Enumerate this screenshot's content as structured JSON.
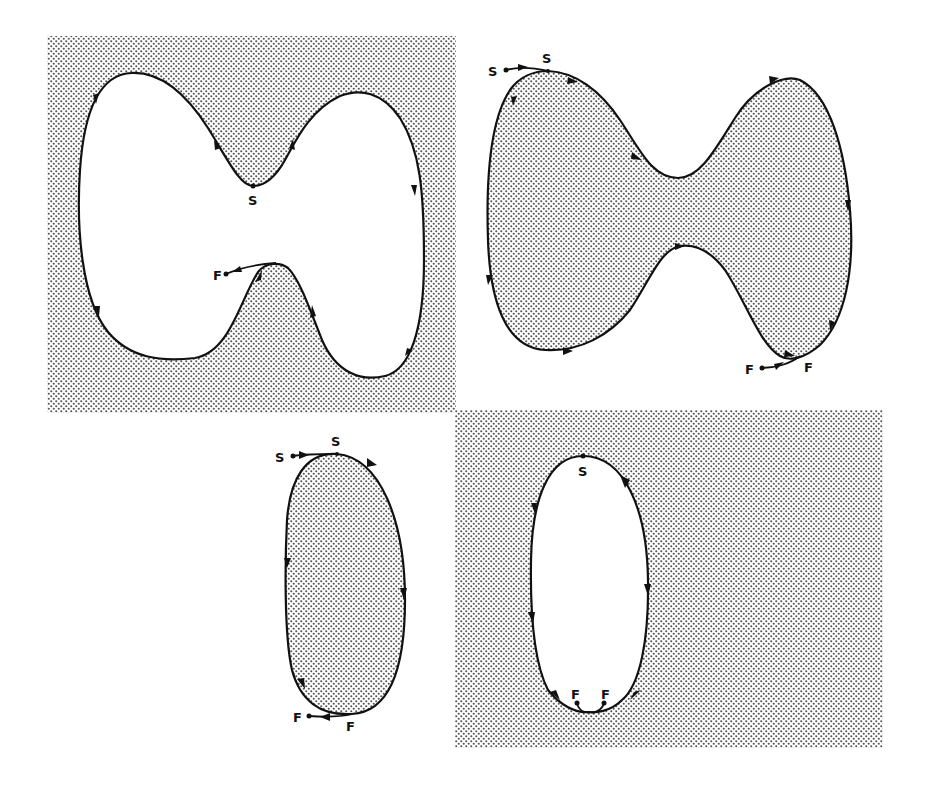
{
  "figure": {
    "colors": {
      "stroke": "#111111",
      "shade_dot": "#555555",
      "background": "#ffffff"
    },
    "panels": [
      {
        "id": "panel-1",
        "shape": "dumbbell",
        "region_shaded": "outside",
        "labels": {
          "start": "S",
          "finish": "F"
        }
      },
      {
        "id": "panel-2",
        "shape": "dumbbell",
        "region_shaded": "inside",
        "labels": {
          "start_outer": "S",
          "start_inner": "S",
          "finish_inner": "F",
          "finish_outer": "F"
        }
      },
      {
        "id": "panel-3",
        "shape": "oval",
        "region_shaded": "inside",
        "labels": {
          "start_outer": "S",
          "start_inner": "S",
          "finish_outer": "F",
          "finish_inner": "F"
        }
      },
      {
        "id": "panel-4",
        "shape": "oval",
        "region_shaded": "outside",
        "labels": {
          "start": "S",
          "finish_left": "F",
          "finish_right": "F"
        }
      }
    ]
  }
}
